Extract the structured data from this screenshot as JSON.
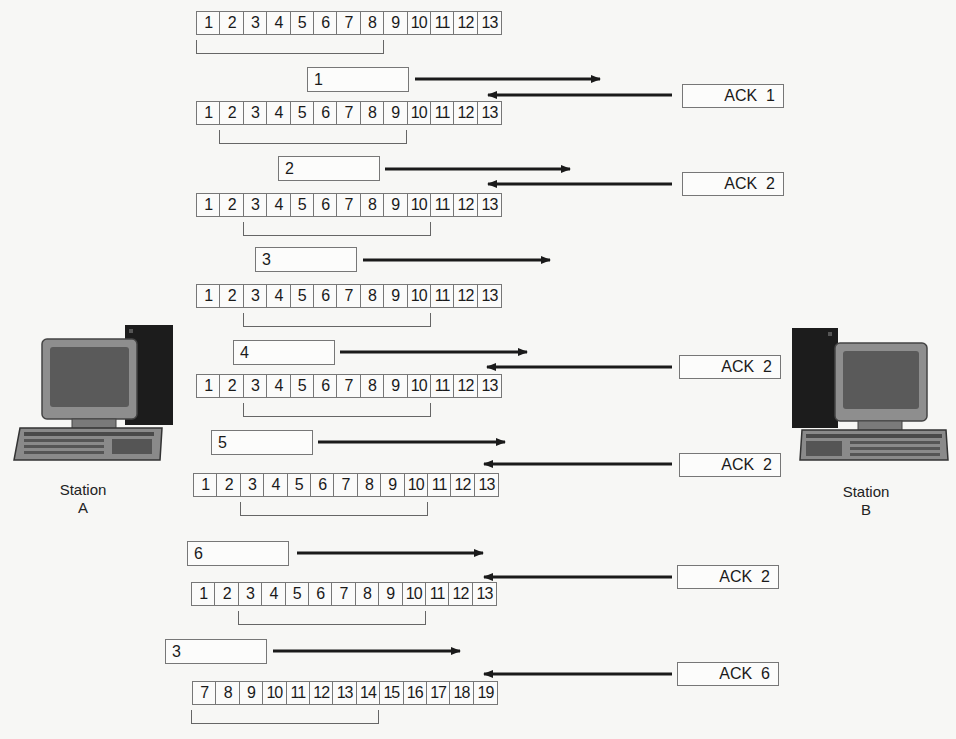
{
  "diagram": {
    "type": "sliding-window-protocol",
    "stations": {
      "a": {
        "label_line1": "Station",
        "label_line2": "A"
      },
      "b": {
        "label_line1": "Station",
        "label_line2": "B"
      }
    },
    "rows": [
      {
        "cells": [
          "1",
          "2",
          "3",
          "4",
          "5",
          "6",
          "7",
          "8",
          "9",
          "10",
          "11",
          "12",
          "13"
        ],
        "window": [
          1,
          8
        ]
      },
      {
        "cells": [
          "1",
          "2",
          "3",
          "4",
          "5",
          "6",
          "7",
          "8",
          "9",
          "10",
          "11",
          "12",
          "13"
        ],
        "window": [
          2,
          9
        ]
      },
      {
        "cells": [
          "1",
          "2",
          "3",
          "4",
          "5",
          "6",
          "7",
          "8",
          "9",
          "10",
          "11",
          "12",
          "13"
        ],
        "window": [
          3,
          10
        ]
      },
      {
        "cells": [
          "1",
          "2",
          "3",
          "4",
          "5",
          "6",
          "7",
          "8",
          "9",
          "10",
          "11",
          "12",
          "13"
        ],
        "window": [
          3,
          10
        ]
      },
      {
        "cells": [
          "1",
          "2",
          "3",
          "4",
          "5",
          "6",
          "7",
          "8",
          "9",
          "10",
          "11",
          "12",
          "13"
        ],
        "window": [
          3,
          10
        ]
      },
      {
        "cells": [
          "1",
          "2",
          "3",
          "4",
          "5",
          "6",
          "7",
          "8",
          "9",
          "10",
          "11",
          "12",
          "13"
        ],
        "window": [
          3,
          10
        ]
      },
      {
        "cells": [
          "1",
          "2",
          "3",
          "4",
          "5",
          "6",
          "7",
          "8",
          "9",
          "10",
          "11",
          "12",
          "13"
        ],
        "window": [
          3,
          10
        ]
      },
      {
        "cells": [
          "7",
          "8",
          "9",
          "10",
          "11",
          "12",
          "13",
          "14",
          "15",
          "16",
          "17",
          "18",
          "19"
        ],
        "window": [
          7,
          14
        ]
      }
    ],
    "frames": [
      {
        "label": "1"
      },
      {
        "label": "2"
      },
      {
        "label": "3"
      },
      {
        "label": "4"
      },
      {
        "label": "5"
      },
      {
        "label": "6"
      },
      {
        "label": "3"
      }
    ],
    "acks": [
      {
        "label": "ACK  1"
      },
      {
        "label": "ACK  2"
      },
      {
        "label": "ACK  2"
      },
      {
        "label": "ACK  2"
      },
      {
        "label": "ACK  2"
      },
      {
        "label": "ACK  6"
      }
    ],
    "colors": {
      "background": "#f7f7f5",
      "line": "#777777",
      "arrow": "#1a1a1a",
      "tower": "#1c1c1c",
      "monitor": "#8e8e8e",
      "screen": "#5a5a5a"
    }
  }
}
